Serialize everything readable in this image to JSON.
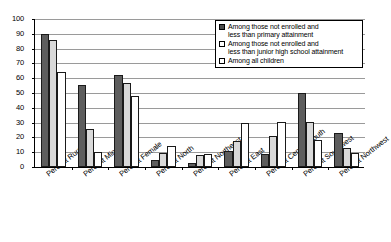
{
  "chart_data": {
    "type": "bar",
    "title": "",
    "subtitle": "",
    "xlabel": "",
    "ylabel": "",
    "ylim": [
      0,
      100
    ],
    "ytick_step": 10,
    "yticks": [
      0,
      10,
      20,
      30,
      40,
      50,
      60,
      70,
      80,
      90,
      100
    ],
    "ytick_labels": [
      "0",
      "10",
      "20",
      "30",
      "40",
      "50",
      "60",
      "70",
      "80",
      "90",
      "100"
    ],
    "grid": true,
    "grid_axis": "y",
    "legend_position": "top-right-inside",
    "categories": [
      "Percent Rural",
      "Percent Minority",
      "Percent Female",
      "Percent North",
      "Percent Northeast",
      "Percent East",
      "Percent Central-South",
      "Percent Southwest",
      "Percent Northwest"
    ],
    "series": [
      {
        "name": "Among those not enrolled and less than primary attainment",
        "name_line1": "Among those not enrolled and",
        "name_line2": "less than primary attainment",
        "color": "#5d5d5d",
        "values": [
          90,
          55.5,
          62,
          5,
          3,
          11,
          9,
          50,
          23
        ]
      },
      {
        "name": "Among those not enrolled and less than junior high school attainment",
        "name_line1": "Among those not enrolled and",
        "name_line2": "less than junior high school attainment",
        "color": "#d9d9d9",
        "values": [
          86,
          25.5,
          57,
          9.5,
          8,
          17.5,
          21,
          30.5,
          13
        ]
      },
      {
        "name": "Among all children",
        "name_line1": "Among all children",
        "name_line2": "",
        "color": "#ffffff",
        "values": [
          64,
          10,
          48,
          14.5,
          8.5,
          30,
          30.5,
          18,
          9.5
        ]
      }
    ]
  }
}
